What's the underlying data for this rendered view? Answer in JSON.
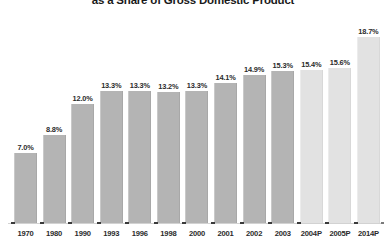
{
  "chart_data": {
    "type": "bar",
    "title": "as a Share of Gross Domestic Product",
    "xlabel": "",
    "ylabel": "",
    "ylim": [
      0,
      20.5
    ],
    "grid": false,
    "legend": "none",
    "categories": [
      "1970",
      "1980",
      "1990",
      "1993",
      "1996",
      "1998",
      "2000",
      "2001",
      "2002",
      "2003",
      "2004P",
      "2005P",
      "2014P"
    ],
    "values": [
      7.0,
      8.8,
      12.0,
      13.3,
      13.3,
      13.2,
      13.3,
      14.1,
      14.9,
      15.3,
      15.4,
      15.6,
      18.7
    ],
    "data_labels": [
      "7.0%",
      "8.8%",
      "12.0%",
      "13.3%",
      "13.3%",
      "13.2%",
      "13.3%",
      "14.1%",
      "14.9%",
      "15.3%",
      "15.4%",
      "15.6%",
      "18.7%"
    ],
    "series": [
      {
        "name": "Share of GDP",
        "values": [
          7.0,
          8.8,
          12.0,
          13.3,
          13.3,
          13.2,
          13.3,
          14.1,
          14.9,
          15.3,
          15.4,
          15.6,
          18.7
        ]
      }
    ],
    "projected_flags": [
      false,
      false,
      false,
      false,
      false,
      false,
      false,
      false,
      false,
      false,
      true,
      true,
      true
    ],
    "colors": {
      "bar_actual": "#b4b4b4",
      "bar_projected": "#e2e2e2",
      "label_text": "#2b2b2b",
      "title_text": "#1a1a1a",
      "axis_line": "#d2d2d2"
    }
  }
}
